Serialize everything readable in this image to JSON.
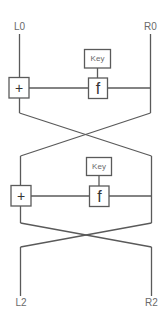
{
  "diagram": {
    "title": "",
    "type": "feistel-network",
    "inputs": {
      "left_label": "L0",
      "right_label": "R0"
    },
    "outputs": {
      "left_label": "L2",
      "right_label": "R2"
    },
    "rounds": [
      {
        "key_label": "Key",
        "function_label": "f",
        "xor_label": "+"
      },
      {
        "key_label": "Key",
        "function_label": "f",
        "xor_label": "+"
      }
    ],
    "colors": {
      "line": "#5a5a5a",
      "label": "#6a6a6a",
      "background": "#ffffff"
    }
  }
}
